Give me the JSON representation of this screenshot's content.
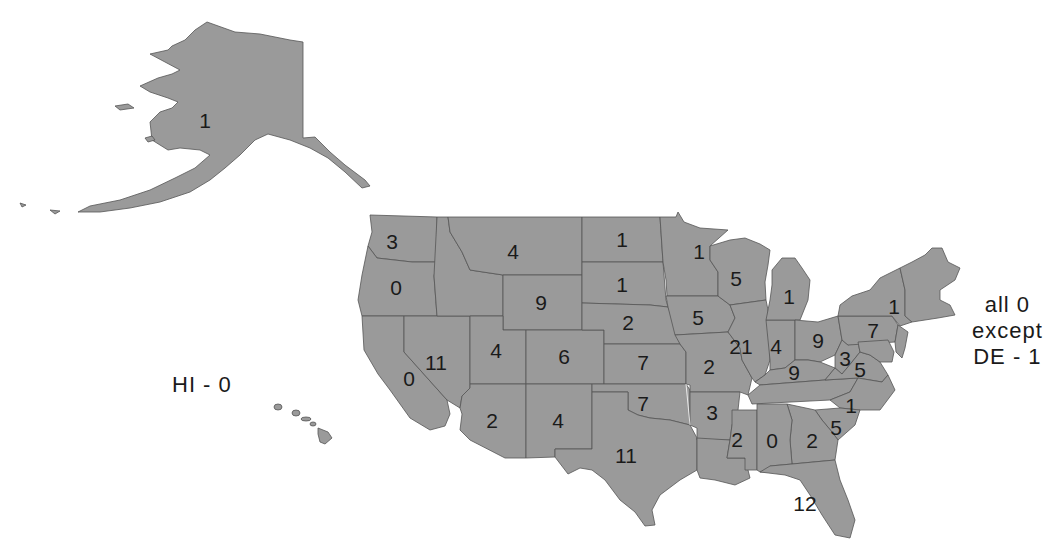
{
  "map": {
    "fill_color": "#9a9a9a",
    "border_color": "#555555",
    "text_color": "#1a1a1a"
  },
  "notes": {
    "hawaii": "HI - 0",
    "northeast_line1": "all 0",
    "northeast_line2": "except",
    "northeast_line3": "DE - 1"
  },
  "states": [
    {
      "abbr": "AK",
      "value": "1",
      "x": 205,
      "y": 120
    },
    {
      "abbr": "WA",
      "value": "3",
      "x": 392,
      "y": 241
    },
    {
      "abbr": "OR",
      "value": "0",
      "x": 396,
      "y": 287
    },
    {
      "abbr": "CA",
      "value": "0",
      "x": 409,
      "y": 378
    },
    {
      "abbr": "NV",
      "value": "11",
      "x": 436,
      "y": 362
    },
    {
      "abbr": "ID_MT",
      "value": "4",
      "x": 513,
      "y": 251
    },
    {
      "abbr": "UT",
      "value": "4",
      "x": 496,
      "y": 350
    },
    {
      "abbr": "WY",
      "value": "9",
      "x": 541,
      "y": 302
    },
    {
      "abbr": "CO",
      "value": "6",
      "x": 564,
      "y": 356
    },
    {
      "abbr": "AZ",
      "value": "2",
      "x": 492,
      "y": 420
    },
    {
      "abbr": "NM",
      "value": "4",
      "x": 558,
      "y": 420
    },
    {
      "abbr": "ND",
      "value": "1",
      "x": 622,
      "y": 239
    },
    {
      "abbr": "SD",
      "value": "1",
      "x": 622,
      "y": 284
    },
    {
      "abbr": "NE",
      "value": "2",
      "x": 628,
      "y": 322
    },
    {
      "abbr": "KS",
      "value": "7",
      "x": 643,
      "y": 362
    },
    {
      "abbr": "OK",
      "value": "7",
      "x": 643,
      "y": 403
    },
    {
      "abbr": "TX",
      "value": "11",
      "x": 626,
      "y": 455
    },
    {
      "abbr": "MN",
      "value": "1",
      "x": 699,
      "y": 251
    },
    {
      "abbr": "IA",
      "value": "5",
      "x": 698,
      "y": 317
    },
    {
      "abbr": "MO",
      "value": "2",
      "x": 709,
      "y": 366
    },
    {
      "abbr": "AR",
      "value": "3",
      "x": 712,
      "y": 412
    },
    {
      "abbr": "LA_MS",
      "value": "2",
      "x": 737,
      "y": 439
    },
    {
      "abbr": "WI",
      "value": "5",
      "x": 736,
      "y": 278
    },
    {
      "abbr": "IL",
      "value": "21",
      "x": 741,
      "y": 346
    },
    {
      "abbr": "MI",
      "value": "1",
      "x": 789,
      "y": 296
    },
    {
      "abbr": "IN",
      "value": "4",
      "x": 776,
      "y": 346
    },
    {
      "abbr": "OH",
      "value": "9",
      "x": 818,
      "y": 340
    },
    {
      "abbr": "KY",
      "value": "9",
      "x": 794,
      "y": 372
    },
    {
      "abbr": "WV",
      "value": "3",
      "x": 845,
      "y": 358
    },
    {
      "abbr": "VA",
      "value": "5",
      "x": 860,
      "y": 369
    },
    {
      "abbr": "PA",
      "value": "7",
      "x": 873,
      "y": 330
    },
    {
      "abbr": "NY",
      "value": "1",
      "x": 894,
      "y": 306
    },
    {
      "abbr": "NC",
      "value": "1",
      "x": 851,
      "y": 405
    },
    {
      "abbr": "SC",
      "value": "5",
      "x": 836,
      "y": 427
    },
    {
      "abbr": "AL",
      "value": "0",
      "x": 772,
      "y": 440
    },
    {
      "abbr": "GA",
      "value": "2",
      "x": 812,
      "y": 440
    },
    {
      "abbr": "FL",
      "value": "12",
      "x": 805,
      "y": 503
    }
  ]
}
